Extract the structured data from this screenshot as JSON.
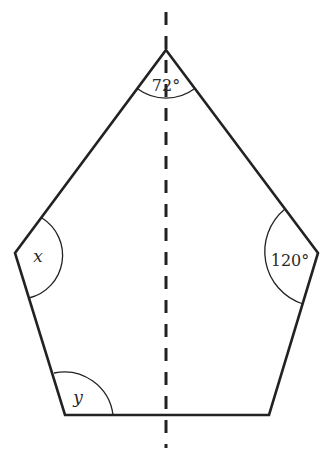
{
  "diagram": {
    "type": "pentagon-with-symmetry-axis",
    "colors": {
      "stroke": "#222222",
      "text": "#2a2a2a",
      "background": "#ffffff"
    },
    "vertices": {
      "top": [
        166,
        50
      ],
      "right": [
        318,
        253
      ],
      "bottom_right": [
        269,
        415
      ],
      "bottom_left": [
        65,
        415
      ],
      "left": [
        15,
        253
      ]
    },
    "symmetry_axis": {
      "x": 166,
      "y_start": 12,
      "y_end": 448,
      "style": "dashed"
    },
    "angles": {
      "top": {
        "label": "72°",
        "value": 72
      },
      "right": {
        "label": "120°",
        "value": 120
      },
      "left": {
        "label": "x",
        "value": null
      },
      "bottom_left": {
        "label": "y",
        "value": null
      }
    }
  }
}
